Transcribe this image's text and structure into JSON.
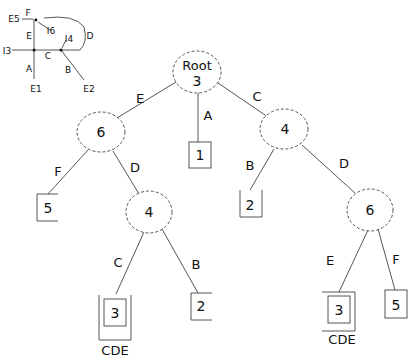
{
  "inset_graph": {
    "vertices": [
      "E5",
      "I6",
      "I4",
      "I3",
      "E1",
      "E2"
    ],
    "edges": [
      {
        "label": "F"
      },
      {
        "label": "E"
      },
      {
        "label": "D"
      },
      {
        "label": "C"
      },
      {
        "label": "A"
      },
      {
        "label": "B"
      }
    ]
  },
  "tree": {
    "root": {
      "title": "Root",
      "value": "3"
    },
    "nodes": [
      {
        "id": "n_left6",
        "value": "6"
      },
      {
        "id": "n_leaf1",
        "value": "1"
      },
      {
        "id": "n_right4",
        "value": "4"
      },
      {
        "id": "n_leaf5a",
        "value": "5"
      },
      {
        "id": "n_mid4",
        "value": "4"
      },
      {
        "id": "n_leaf2a",
        "value": "2"
      },
      {
        "id": "n_right6",
        "value": "6"
      },
      {
        "id": "n_leaf3a",
        "value": "3",
        "caption": "CDE"
      },
      {
        "id": "n_leaf2b",
        "value": "2"
      },
      {
        "id": "n_leaf3b",
        "value": "3",
        "caption": "CDE"
      },
      {
        "id": "n_leaf5b",
        "value": "5"
      }
    ],
    "edges": [
      {
        "from": "root",
        "to": "n_left6",
        "label": "E"
      },
      {
        "from": "root",
        "to": "n_leaf1",
        "label": "A"
      },
      {
        "from": "root",
        "to": "n_right4",
        "label": "C"
      },
      {
        "from": "n_left6",
        "to": "n_leaf5a",
        "label": "F"
      },
      {
        "from": "n_left6",
        "to": "n_mid4",
        "label": "D"
      },
      {
        "from": "n_right4",
        "to": "n_leaf2a",
        "label": "B"
      },
      {
        "from": "n_right4",
        "to": "n_right6",
        "label": "D"
      },
      {
        "from": "n_mid4",
        "to": "n_leaf3a",
        "label": "C"
      },
      {
        "from": "n_mid4",
        "to": "n_leaf2b",
        "label": "B"
      },
      {
        "from": "n_right6",
        "to": "n_leaf3b",
        "label": "E"
      },
      {
        "from": "n_right6",
        "to": "n_leaf5b",
        "label": "F"
      }
    ]
  }
}
